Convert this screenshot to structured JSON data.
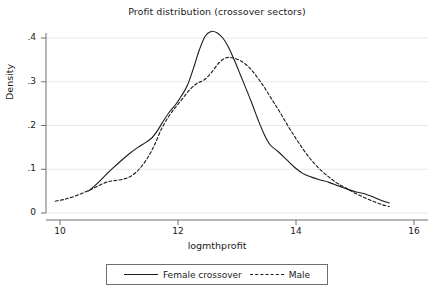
{
  "chart_data": {
    "type": "line",
    "title": "Profit distribution (crossover sectors)",
    "xlabel": "logmthprofit",
    "ylabel": "Density",
    "xlim": [
      10,
      16
    ],
    "ylim": [
      0,
      0.4
    ],
    "xticks": [
      "10",
      "12",
      "14",
      "16"
    ],
    "xtick_values": [
      10,
      12,
      14,
      16
    ],
    "yticks": [
      "0",
      ".1",
      ".2",
      ".3",
      ".4"
    ],
    "ytick_values": [
      0,
      0.1,
      0.2,
      0.3,
      0.4
    ],
    "grid": "horizontal",
    "legend_position": "bottom",
    "series": [
      {
        "name": "Female crossover",
        "style": "solid",
        "color": "#1a1a1a",
        "points": [
          [
            10.48,
            0.05
          ],
          [
            10.62,
            0.066
          ],
          [
            10.76,
            0.085
          ],
          [
            10.9,
            0.103
          ],
          [
            11.04,
            0.12
          ],
          [
            11.18,
            0.136
          ],
          [
            11.32,
            0.15
          ],
          [
            11.46,
            0.162
          ],
          [
            11.56,
            0.172
          ],
          [
            11.66,
            0.19
          ],
          [
            11.76,
            0.212
          ],
          [
            11.86,
            0.232
          ],
          [
            11.96,
            0.248
          ],
          [
            12.06,
            0.268
          ],
          [
            12.16,
            0.292
          ],
          [
            12.26,
            0.33
          ],
          [
            12.36,
            0.372
          ],
          [
            12.46,
            0.404
          ],
          [
            12.56,
            0.415
          ],
          [
            12.66,
            0.412
          ],
          [
            12.76,
            0.4
          ],
          [
            12.86,
            0.378
          ],
          [
            12.96,
            0.348
          ],
          [
            13.06,
            0.315
          ],
          [
            13.16,
            0.282
          ],
          [
            13.26,
            0.248
          ],
          [
            13.36,
            0.212
          ],
          [
            13.46,
            0.18
          ],
          [
            13.56,
            0.156
          ],
          [
            13.7,
            0.14
          ],
          [
            13.84,
            0.122
          ],
          [
            13.98,
            0.104
          ],
          [
            14.12,
            0.09
          ],
          [
            14.26,
            0.082
          ],
          [
            14.4,
            0.076
          ],
          [
            14.56,
            0.07
          ],
          [
            14.72,
            0.062
          ],
          [
            14.88,
            0.054
          ],
          [
            15.02,
            0.048
          ],
          [
            15.16,
            0.044
          ],
          [
            15.32,
            0.036
          ],
          [
            15.46,
            0.028
          ],
          [
            15.58,
            0.023
          ]
        ]
      },
      {
        "name": "Male",
        "style": "dashed",
        "color": "#1a1a1a",
        "points": [
          [
            9.92,
            0.027
          ],
          [
            10.1,
            0.032
          ],
          [
            10.28,
            0.04
          ],
          [
            10.46,
            0.05
          ],
          [
            10.62,
            0.06
          ],
          [
            10.78,
            0.07
          ],
          [
            10.92,
            0.074
          ],
          [
            11.06,
            0.077
          ],
          [
            11.2,
            0.084
          ],
          [
            11.34,
            0.1
          ],
          [
            11.48,
            0.125
          ],
          [
            11.6,
            0.155
          ],
          [
            11.72,
            0.192
          ],
          [
            11.84,
            0.22
          ],
          [
            11.96,
            0.242
          ],
          [
            12.08,
            0.262
          ],
          [
            12.2,
            0.282
          ],
          [
            12.32,
            0.296
          ],
          [
            12.44,
            0.304
          ],
          [
            12.56,
            0.32
          ],
          [
            12.7,
            0.344
          ],
          [
            12.82,
            0.355
          ],
          [
            12.94,
            0.354
          ],
          [
            13.06,
            0.348
          ],
          [
            13.18,
            0.336
          ],
          [
            13.3,
            0.318
          ],
          [
            13.44,
            0.292
          ],
          [
            13.58,
            0.262
          ],
          [
            13.72,
            0.232
          ],
          [
            13.86,
            0.2
          ],
          [
            14.0,
            0.17
          ],
          [
            14.14,
            0.142
          ],
          [
            14.28,
            0.118
          ],
          [
            14.42,
            0.098
          ],
          [
            14.56,
            0.082
          ],
          [
            14.7,
            0.068
          ],
          [
            14.86,
            0.056
          ],
          [
            15.02,
            0.044
          ],
          [
            15.18,
            0.034
          ],
          [
            15.34,
            0.025
          ],
          [
            15.48,
            0.018
          ],
          [
            15.58,
            0.015
          ]
        ]
      }
    ]
  },
  "legend": {
    "items": [
      {
        "label": "Female crossover",
        "style": "solid"
      },
      {
        "label": "Male",
        "style": "dashed"
      }
    ]
  },
  "colors": {
    "line": "#1a1a1a",
    "grid": "#e8e8e8",
    "axis": "#6e6e6e",
    "background": "#ffffff"
  }
}
